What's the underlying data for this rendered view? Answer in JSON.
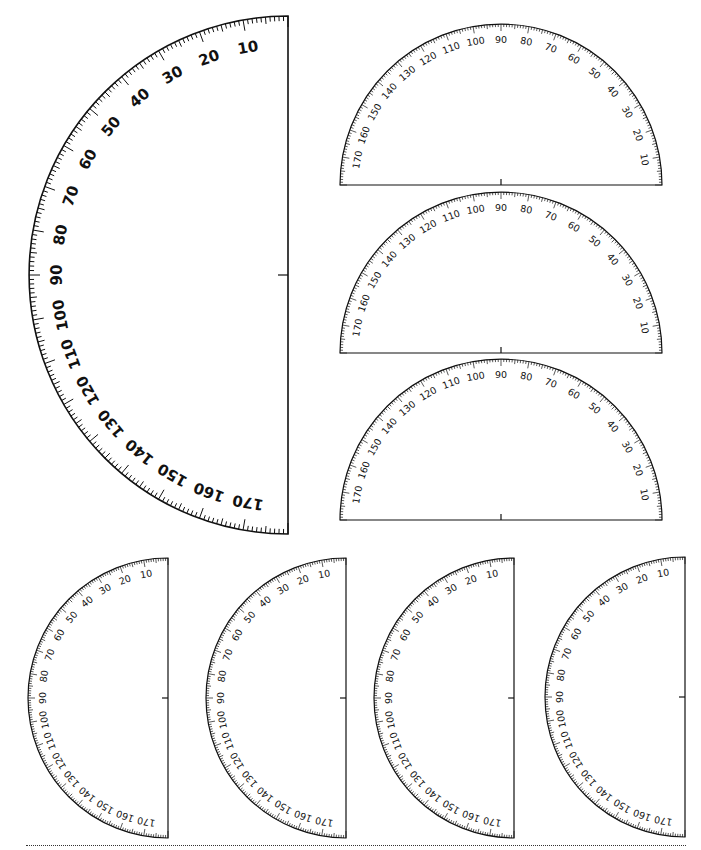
{
  "sheet": {
    "title": "Printable protractors",
    "ink_color": "#111111",
    "background": "#ffffff"
  },
  "scale": {
    "min_degrees": 0,
    "max_degrees": 180,
    "minor_step": 1,
    "mid_step": 5,
    "major_step": 10,
    "labels": [
      "10",
      "20",
      "30",
      "40",
      "50",
      "60",
      "70",
      "80",
      "90",
      "100",
      "110",
      "120",
      "130",
      "140",
      "150",
      "160",
      "170"
    ]
  },
  "protractors": [
    {
      "id": "large-vertical",
      "orientation": "vertical-left",
      "cx": 288,
      "cy": 275,
      "r": 259,
      "size": "big",
      "tick_minor": 5,
      "tick_mid": 7,
      "tick_major": 11,
      "label_inset": 28
    },
    {
      "id": "horizontal-1",
      "orientation": "horizontal-up",
      "cx": 501,
      "cy": 185,
      "r": 161,
      "size": "small",
      "tick_minor": 3,
      "tick_mid": 4.5,
      "tick_major": 7,
      "label_inset": 15
    },
    {
      "id": "horizontal-2",
      "orientation": "horizontal-up",
      "cx": 501,
      "cy": 353,
      "r": 161,
      "size": "small",
      "tick_minor": 3,
      "tick_mid": 4.5,
      "tick_major": 7,
      "label_inset": 15
    },
    {
      "id": "horizontal-3",
      "orientation": "horizontal-up",
      "cx": 501,
      "cy": 520,
      "r": 161,
      "size": "small",
      "tick_minor": 3,
      "tick_mid": 4.5,
      "tick_major": 7,
      "label_inset": 15
    },
    {
      "id": "small-vertical-1",
      "orientation": "vertical-left",
      "cx": 168,
      "cy": 698,
      "r": 140,
      "size": "small",
      "tick_minor": 3,
      "tick_mid": 4.5,
      "tick_major": 7,
      "label_inset": 14
    },
    {
      "id": "small-vertical-2",
      "orientation": "vertical-left",
      "cx": 346,
      "cy": 698,
      "r": 140,
      "size": "small",
      "tick_minor": 3,
      "tick_mid": 4.5,
      "tick_major": 7,
      "label_inset": 14
    },
    {
      "id": "small-vertical-3",
      "orientation": "vertical-left",
      "cx": 514,
      "cy": 698,
      "r": 140,
      "size": "small",
      "tick_minor": 3,
      "tick_mid": 4.5,
      "tick_major": 7,
      "label_inset": 14
    },
    {
      "id": "small-vertical-4",
      "orientation": "vertical-left",
      "cx": 685,
      "cy": 697,
      "r": 140,
      "size": "small",
      "tick_minor": 3,
      "tick_mid": 4.5,
      "tick_major": 7,
      "label_inset": 14
    }
  ],
  "cut_line": {
    "style": "dotted",
    "y": 846,
    "x_start": 26,
    "x_end": 686
  }
}
